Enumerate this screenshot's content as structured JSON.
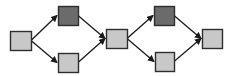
{
  "diagram": {
    "type": "directed-graph",
    "colors": {
      "background": "#ffffff",
      "light_node": "#c8c8c8",
      "dark_node": "#6b6b6b",
      "border": "#2e2e2e",
      "edge": "#1a1a1a"
    },
    "nodes": [
      {
        "id": "n1",
        "shade": "light",
        "x": 10,
        "y": 31,
        "w": 21,
        "h": 19
      },
      {
        "id": "n2",
        "shade": "dark",
        "x": 58,
        "y": 6,
        "w": 20,
        "h": 19
      },
      {
        "id": "n3",
        "shade": "light",
        "x": 58,
        "y": 53,
        "w": 20,
        "h": 19
      },
      {
        "id": "n4",
        "shade": "light",
        "x": 106,
        "y": 29,
        "w": 21,
        "h": 19
      },
      {
        "id": "n5",
        "shade": "dark",
        "x": 154,
        "y": 6,
        "w": 20,
        "h": 19
      },
      {
        "id": "n6",
        "shade": "light",
        "x": 155,
        "y": 52,
        "w": 19,
        "h": 19
      },
      {
        "id": "n7",
        "shade": "light",
        "x": 202,
        "y": 29,
        "w": 20,
        "h": 19
      }
    ],
    "edges": [
      {
        "from": "n1",
        "to": "n2"
      },
      {
        "from": "n1",
        "to": "n3"
      },
      {
        "from": "n2",
        "to": "n4"
      },
      {
        "from": "n3",
        "to": "n4"
      },
      {
        "from": "n4",
        "to": "n5"
      },
      {
        "from": "n4",
        "to": "n6"
      },
      {
        "from": "n5",
        "to": "n7"
      },
      {
        "from": "n6",
        "to": "n7"
      }
    ]
  }
}
